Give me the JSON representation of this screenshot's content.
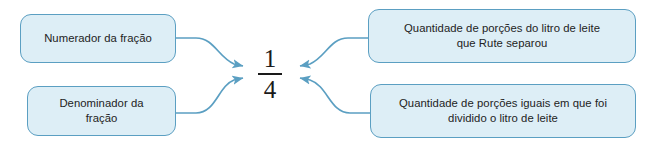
{
  "diagram": {
    "colors": {
      "box_fill": "#ddeef6",
      "box_border": "#5b9fc2",
      "connector": "#5b9fc2",
      "text": "#232323",
      "fraction_text": "#1a1a1a",
      "background": "#ffffff"
    },
    "center": {
      "numerator": "1",
      "denominator": "4",
      "fraction_label": "1/4"
    },
    "boxes": [
      {
        "id": "numerador",
        "label": "Numerador da fração",
        "position": "top-left"
      },
      {
        "id": "denominador",
        "label": "Denominador da\nfração",
        "position": "bottom-left"
      },
      {
        "id": "porcoes-separou",
        "label": "Quantidade de porções do litro de leite\nque Rute separou",
        "position": "top-right"
      },
      {
        "id": "porcoes-divididas",
        "label": "Quantidade de porções iguais em que foi\ndividido o litro de leite",
        "position": "bottom-right"
      }
    ],
    "connectors": [
      {
        "id": "numerador-to-numerator",
        "from": "numerador",
        "to": "numerator",
        "arrow": "end"
      },
      {
        "id": "denominador-to-denominator",
        "from": "denominador",
        "to": "denominator",
        "arrow": "end"
      },
      {
        "id": "porcoes-separou-to-numerator",
        "from": "porcoes-separou",
        "to": "numerator",
        "arrow": "end"
      },
      {
        "id": "porcoes-divididas-to-denominator",
        "from": "porcoes-divididas",
        "to": "denominator",
        "arrow": "end"
      }
    ]
  }
}
